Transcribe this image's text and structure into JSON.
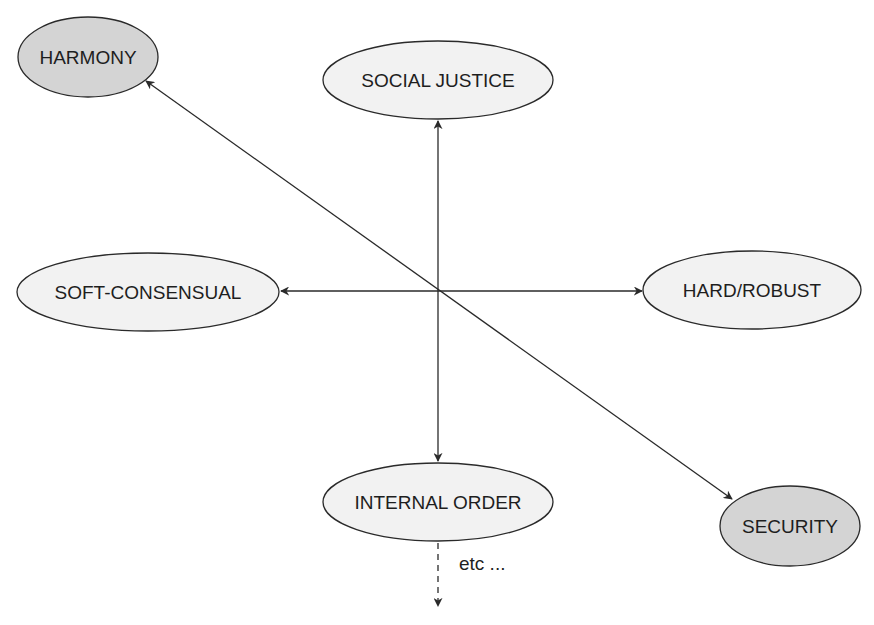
{
  "diagram": {
    "nodes": [
      {
        "id": "harmony",
        "label": "HARMONY",
        "fill": "#d4d4d4",
        "cx": 88,
        "cy": 57,
        "rx": 70,
        "ry": 40
      },
      {
        "id": "social-justice",
        "label": "SOCIAL JUSTICE",
        "fill": "#f2f2f2",
        "cx": 438,
        "cy": 80,
        "rx": 115,
        "ry": 39
      },
      {
        "id": "soft-consensual",
        "label": "SOFT-CONSENSUAL",
        "fill": "#f2f2f2",
        "cx": 148,
        "cy": 292,
        "rx": 131,
        "ry": 39
      },
      {
        "id": "hard-robust",
        "label": "HARD/ROBUST",
        "fill": "#f2f2f2",
        "cx": 752,
        "cy": 290,
        "rx": 109,
        "ry": 39
      },
      {
        "id": "internal-order",
        "label": "INTERNAL ORDER",
        "fill": "#f2f2f2",
        "cx": 438,
        "cy": 502,
        "rx": 115,
        "ry": 39
      },
      {
        "id": "security",
        "label": "SECURITY",
        "fill": "#d4d4d4",
        "cx": 790,
        "cy": 526,
        "rx": 70,
        "ry": 40
      }
    ],
    "edges": [
      {
        "from": "center",
        "to": "social-justice",
        "style": "solid",
        "bidirectional": true
      },
      {
        "from": "center",
        "to": "internal-order",
        "style": "solid",
        "bidirectional": true
      },
      {
        "from": "center",
        "to": "soft-consensual",
        "style": "solid",
        "bidirectional": true
      },
      {
        "from": "center",
        "to": "hard-robust",
        "style": "solid",
        "bidirectional": true
      },
      {
        "from": "harmony",
        "to": "security",
        "style": "solid",
        "bidirectional": true
      },
      {
        "from": "internal-order",
        "to": "continuation",
        "style": "dashed",
        "bidirectional": false
      }
    ],
    "continuation_label": "etc ...",
    "colors": {
      "stroke": "#2a2a2a",
      "shaded_fill": "#d4d4d4",
      "light_fill": "#f2f2f2",
      "text": "#1e1e1e"
    }
  }
}
